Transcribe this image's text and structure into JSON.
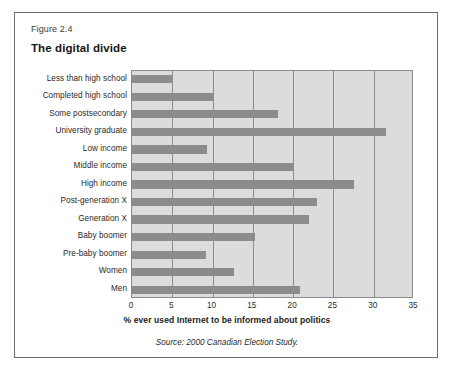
{
  "figure": {
    "number": "Figure 2.4",
    "title": "The digital divide",
    "source": "Source: 2000 Canadian Election Study."
  },
  "chart_data": {
    "type": "bar",
    "orientation": "horizontal",
    "title": "The digital divide",
    "xlabel": "% ever used Internet to be informed about politics",
    "ylabel": "",
    "xlim": [
      0,
      35
    ],
    "xticks": [
      0,
      5,
      10,
      15,
      20,
      25,
      30,
      35
    ],
    "grid": true,
    "legend": false,
    "bar_color": "#8c8c8c",
    "plot_background": "#dcdcdc",
    "categories": [
      "Less than high school",
      "Completed high school",
      "Some postsecondary",
      "University graduate",
      "Low income",
      "Middle income",
      "High income",
      "Post-generation X",
      "Generation X",
      "Baby boomer",
      "Pre-baby boomer",
      "Women",
      "Men"
    ],
    "values": [
      5.0,
      10.0,
      18.1,
      31.5,
      9.3,
      20.0,
      27.6,
      22.9,
      22.0,
      15.3,
      9.2,
      12.7,
      20.8
    ]
  }
}
